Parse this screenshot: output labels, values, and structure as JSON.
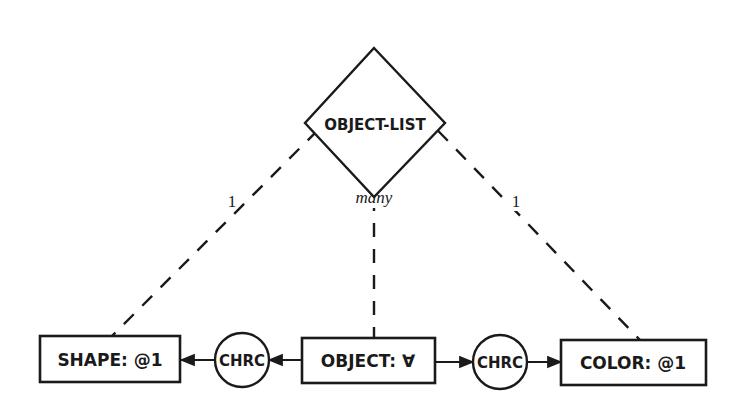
{
  "diagram": {
    "root": {
      "label": "OBJECT-LIST",
      "shape": "diamond"
    },
    "entities": [
      {
        "id": "shape",
        "label": "SHAPE: @1"
      },
      {
        "id": "object",
        "label": "OBJECT: ∀"
      },
      {
        "id": "color",
        "label": "COLOR: @1"
      }
    ],
    "relations": [
      {
        "id": "chrc-left",
        "label": "CHRC",
        "from": "object",
        "to": "shape"
      },
      {
        "id": "chrc-right",
        "label": "CHRC",
        "from": "object",
        "to": "color"
      }
    ],
    "links": [
      {
        "from": "OBJECT-LIST",
        "to": "shape",
        "cardinality": "1",
        "style": "dashed"
      },
      {
        "from": "OBJECT-LIST",
        "to": "object",
        "cardinality": "many",
        "style": "dashed"
      },
      {
        "from": "OBJECT-LIST",
        "to": "color",
        "cardinality": "1",
        "style": "dashed"
      }
    ],
    "colors": {
      "ink": "#1a1a1a",
      "background": "#ffffff"
    }
  }
}
